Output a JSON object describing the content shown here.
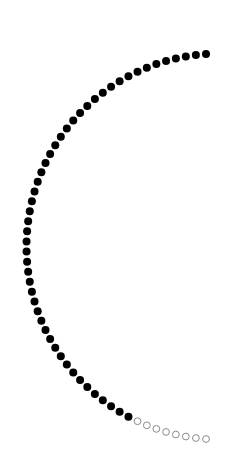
{
  "figure": {
    "total_dots": 58,
    "filled_dots": 50,
    "empty_dots": 8,
    "center": [
      219.5,
      246.5
    ],
    "radius": 193,
    "start_point": [
      206,
      54
    ],
    "end_point": [
      206,
      439
    ],
    "dot_radius": 4,
    "colors": {
      "filled": "#000000",
      "empty_stroke": "#8a8a8a",
      "empty_fill": "#ffffff",
      "background": "#ffffff"
    }
  }
}
